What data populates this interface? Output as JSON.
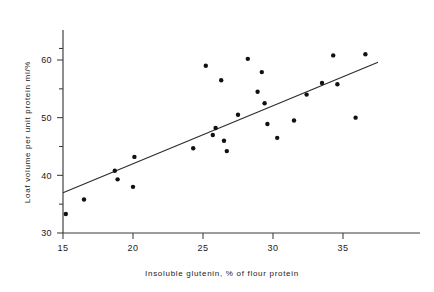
{
  "chart_data": {
    "type": "scatter",
    "title": "",
    "xlabel": "Insoluble glutenin, % of flour protein",
    "ylabel": "Loaf volume per unit protein ml/%",
    "xlim": [
      14.0,
      38.4
    ],
    "ylim": [
      30,
      64
    ],
    "xticks": [
      15,
      20,
      25,
      30,
      35
    ],
    "xtick_labels": [
      "15",
      "20",
      "25",
      "30",
      "35"
    ],
    "yticks": [
      30,
      40,
      50,
      60
    ],
    "ytick_labels": [
      "30",
      "40",
      "50",
      "60"
    ],
    "yticks_minor": [
      35,
      45,
      55,
      62
    ],
    "grid": false,
    "legend": null,
    "marker": "filled-circle",
    "marker_color": "#111111",
    "points": [
      {
        "x": 15.2,
        "y": 33.3
      },
      {
        "x": 16.5,
        "y": 35.8
      },
      {
        "x": 18.7,
        "y": 40.8
      },
      {
        "x": 18.9,
        "y": 39.3
      },
      {
        "x": 20.0,
        "y": 38.0
      },
      {
        "x": 20.1,
        "y": 43.2
      },
      {
        "x": 24.3,
        "y": 44.7
      },
      {
        "x": 25.2,
        "y": 59.0
      },
      {
        "x": 25.7,
        "y": 47.0
      },
      {
        "x": 25.9,
        "y": 48.2
      },
      {
        "x": 26.3,
        "y": 56.5
      },
      {
        "x": 26.5,
        "y": 46.0
      },
      {
        "x": 26.7,
        "y": 44.2
      },
      {
        "x": 27.5,
        "y": 50.5
      },
      {
        "x": 28.2,
        "y": 60.2
      },
      {
        "x": 28.9,
        "y": 54.5
      },
      {
        "x": 29.2,
        "y": 57.9
      },
      {
        "x": 29.4,
        "y": 52.5
      },
      {
        "x": 29.6,
        "y": 48.9
      },
      {
        "x": 30.3,
        "y": 46.5
      },
      {
        "x": 31.5,
        "y": 49.5
      },
      {
        "x": 32.4,
        "y": 54.0
      },
      {
        "x": 33.5,
        "y": 56.0
      },
      {
        "x": 34.3,
        "y": 60.8
      },
      {
        "x": 34.6,
        "y": 55.8
      },
      {
        "x": 35.9,
        "y": 50.0
      },
      {
        "x": 36.6,
        "y": 61.0
      }
    ],
    "fit_line": {
      "type": "linear-regression",
      "x_start": 15.0,
      "y_start": 37.0,
      "x_end": 37.5,
      "y_end": 59.6
    }
  }
}
